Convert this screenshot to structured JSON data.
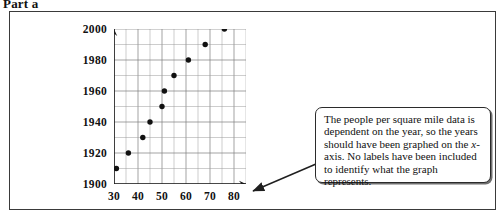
{
  "header": {
    "part_label": "Part a"
  },
  "callout": {
    "text": "The people per square mile data is dependent on the year, so the years should have been graphed on the x-axis. No labels have been included to identify what the graph represents.",
    "segments": [
      {
        "text": "The people per square mile data is dependent on the year, so the years should have been graphed on the ",
        "style": "normal"
      },
      {
        "text": "x",
        "style": "italic"
      },
      {
        "text": "-axis. No labels have been included to identify what the graph represents.",
        "style": "normal"
      }
    ],
    "arrow": "arrow-pointing-to-x-axis-end"
  },
  "chart_data": {
    "type": "scatter",
    "title": "",
    "xlabel": "",
    "ylabel": "",
    "xlim": [
      30,
      85
    ],
    "ylim": [
      1900,
      2000
    ],
    "xticks": [
      30,
      40,
      50,
      60,
      70,
      80
    ],
    "yticks": [
      1900,
      1920,
      1940,
      1960,
      1980,
      2000
    ],
    "x_minor_step": 5,
    "y_minor_step": 10,
    "grid": true,
    "legend": "none",
    "x": [
      31,
      36,
      42,
      45,
      50,
      51,
      55,
      61,
      68,
      76
    ],
    "y": [
      1910,
      1920,
      1930,
      1940,
      1950,
      1960,
      1970,
      1980,
      1990,
      2000
    ],
    "points": [
      {
        "x": 31,
        "y": 1910
      },
      {
        "x": 36,
        "y": 1920
      },
      {
        "x": 42,
        "y": 1930
      },
      {
        "x": 45,
        "y": 1940
      },
      {
        "x": 50,
        "y": 1950
      },
      {
        "x": 51,
        "y": 1960
      },
      {
        "x": 55,
        "y": 1970
      },
      {
        "x": 61,
        "y": 1980
      },
      {
        "x": 68,
        "y": 1990
      },
      {
        "x": 76,
        "y": 2000
      }
    ]
  },
  "colors": {
    "point": "#111111",
    "grid": "#7d7d7d",
    "axis": "#1a1a1a",
    "frame": "#3a3a3a",
    "callout_border": "#2b2b2b"
  }
}
